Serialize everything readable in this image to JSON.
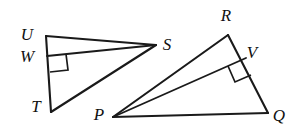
{
  "figure": {
    "background_color": "#ffffff",
    "stroke_color": "#1a1a1a",
    "width": 291,
    "height": 135
  },
  "labels": {
    "U": "U",
    "W": "W",
    "T": "T",
    "S": "S",
    "R": "R",
    "V": "V",
    "P": "P",
    "Q": "Q"
  },
  "points": {
    "U": {
      "x": 46,
      "y": 36
    },
    "W": {
      "x": 47,
      "y": 56
    },
    "T": {
      "x": 51,
      "y": 112
    },
    "S": {
      "x": 156,
      "y": 45
    },
    "R": {
      "x": 228,
      "y": 35
    },
    "V": {
      "x": 246,
      "y": 58
    },
    "P": {
      "x": 113,
      "y": 117
    },
    "Q": {
      "x": 268,
      "y": 113
    }
  },
  "label_positions": {
    "U": {
      "x": 27,
      "y": 36
    },
    "W": {
      "x": 27,
      "y": 58
    },
    "T": {
      "x": 36,
      "y": 108
    },
    "S": {
      "x": 167,
      "y": 46
    },
    "R": {
      "x": 226,
      "y": 17
    },
    "V": {
      "x": 252,
      "y": 54
    },
    "P": {
      "x": 99,
      "y": 116
    },
    "Q": {
      "x": 279,
      "y": 117
    }
  },
  "segments": [
    {
      "name": "U-S",
      "from": "U",
      "to": "S"
    },
    {
      "name": "U-T",
      "from": "U",
      "to": "T"
    },
    {
      "name": "T-S",
      "from": "T",
      "to": "S"
    },
    {
      "name": "W-S",
      "from": "W",
      "to": "S"
    },
    {
      "name": "P-R",
      "from": "P",
      "to": "R"
    },
    {
      "name": "R-Q",
      "from": "R",
      "to": "Q"
    },
    {
      "name": "P-Q",
      "from": "P",
      "to": "Q"
    },
    {
      "name": "P-V",
      "from": "P",
      "to": "V"
    }
  ],
  "right_angles": [
    {
      "name": "right-angle-at-W",
      "vertex": "W"
    },
    {
      "name": "right-angle-at-V",
      "vertex": "V"
    }
  ]
}
